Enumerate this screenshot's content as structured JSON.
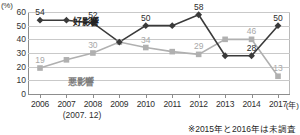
{
  "axis": {
    "unit_label": "(%)",
    "x_unit": "(年)",
    "y_ticks": [
      "0",
      "10",
      "20",
      "30",
      "40",
      "50",
      "60"
    ],
    "x_ticks": [
      "2006",
      "2007",
      "2008",
      "2009",
      "2010",
      "2011",
      "2012",
      "2013",
      "2014",
      "2017"
    ],
    "subnote": "(2007. 12)"
  },
  "footnote": "※2015年と2016年は未調査",
  "series_names": {
    "good": "好影響",
    "bad": "悪影響"
  },
  "colors": {
    "good": "#3a3a3a",
    "bad": "#b0b0b0",
    "grid": "#c9c9c9",
    "axis": "#8d8d8d"
  },
  "chart_data": {
    "type": "line",
    "title": "",
    "xlabel": "(年)",
    "ylabel": "(%)",
    "ylim": [
      0,
      60
    ],
    "grid": true,
    "legend": "inline-annotation",
    "categories": [
      "2006",
      "2007",
      "2008",
      "2009",
      "2010",
      "2011",
      "2012",
      "2013",
      "2014",
      "2017"
    ],
    "series": [
      {
        "name": "好影響",
        "marker": "diamond",
        "color": "#3a3a3a",
        "values": [
          54,
          54,
          52,
          38,
          50,
          50,
          58,
          28,
          28,
          50
        ],
        "labels": [
          "54",
          "",
          "52",
          "",
          "50",
          "",
          "58",
          "",
          "28",
          "50"
        ]
      },
      {
        "name": "悪影響",
        "marker": "square",
        "color": "#b0b0b0",
        "values": [
          19,
          25,
          30,
          38,
          34,
          31,
          29,
          40,
          40,
          13
        ],
        "labels": [
          "19",
          "",
          "30",
          "",
          "34",
          "",
          "29",
          "",
          "46",
          "13"
        ]
      }
    ]
  }
}
